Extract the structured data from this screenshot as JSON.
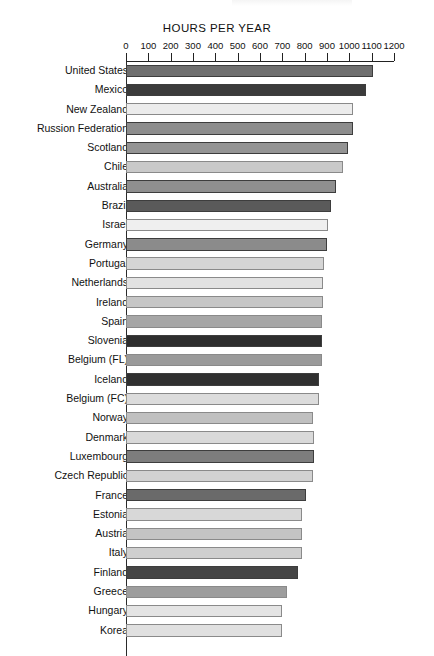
{
  "chart_data": {
    "type": "bar",
    "orientation": "horizontal",
    "title": "HOURS PER YEAR",
    "xlabel": "",
    "ylabel": "",
    "xlim": [
      0,
      1200
    ],
    "xticks": [
      0,
      100,
      200,
      300,
      400,
      500,
      600,
      700,
      800,
      900,
      1000,
      1100,
      1200
    ],
    "grid": false,
    "legend": false,
    "categories": [
      "United States",
      "Mexico",
      "New Zealand",
      "Russion Federation",
      "Scotland",
      "Chile",
      "Australia",
      "Brazil",
      "Israel",
      "Germany",
      "Portugal",
      "Netherlands",
      "Ireland",
      "Spain",
      "Slovenia",
      "Belgium (FL)",
      "Iceland",
      "Belgium (FC)",
      "Norway",
      "Denmark",
      "Luxembourg",
      "Czech Republic",
      "France",
      "Estonia",
      "Austria",
      "Italy",
      "Finland",
      "Greece",
      "Hungary",
      "Korea"
    ],
    "values": [
      1105,
      1075,
      1015,
      1015,
      995,
      970,
      940,
      920,
      905,
      900,
      885,
      880,
      882,
      878,
      878,
      876,
      866,
      862,
      836,
      840,
      840,
      836,
      805,
      788,
      786,
      788,
      768,
      722,
      700,
      700
    ],
    "bar_colors": [
      "#6f6f6f",
      "#3b3b3b",
      "#ececec",
      "#8d8d8d",
      "#949494",
      "#c9c9c9",
      "#8f8f8f",
      "#5a5a5a",
      "#efefef",
      "#8b8b8b",
      "#d5d5d5",
      "#e2e2e2",
      "#c6c6c6",
      "#a6a6a6",
      "#2e2e2e",
      "#9a9a9a",
      "#303030",
      "#dcdcdc",
      "#c0c0c0",
      "#d9d9d9",
      "#7d7d7d",
      "#d2d2d2",
      "#6a6a6a",
      "#d8d8d8",
      "#c4c4c4",
      "#cfcfcf",
      "#454545",
      "#9d9d9d",
      "#e4e4e4",
      "#e0e0e0"
    ]
  },
  "axis": {
    "tick_labels": [
      "0",
      "100",
      "200",
      "300",
      "400",
      "500",
      "600",
      "700",
      "800",
      "900",
      "1000",
      "1100",
      "1200"
    ]
  }
}
